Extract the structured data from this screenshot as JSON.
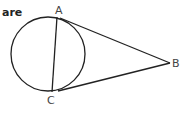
{
  "text_fragment": "are",
  "diagram": {
    "type": "circle-with-tangents",
    "points": {
      "A": {
        "label": "A",
        "x": 57,
        "y": 17
      },
      "B": {
        "label": "B",
        "x": 170,
        "y": 63
      },
      "C": {
        "label": "C",
        "x": 52,
        "y": 92
      }
    },
    "circle": {
      "cx": 48,
      "cy": 54,
      "r": 37
    },
    "segments": [
      "AC",
      "AB",
      "CB"
    ],
    "stroke_color": "#222222"
  }
}
